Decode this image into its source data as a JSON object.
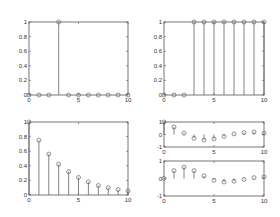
{
  "figure": {
    "background": "#ffffff",
    "axis_color": "#555555",
    "stem_color": "#666666"
  },
  "chart_data": [
    {
      "type": "stem",
      "title": "",
      "xlabel": "",
      "ylabel": "",
      "x": [
        0,
        1,
        2,
        3,
        4,
        5,
        6,
        7,
        8,
        9,
        10
      ],
      "values": [
        0,
        0,
        0,
        1,
        0,
        0,
        0,
        0,
        0,
        0,
        0
      ],
      "xlim": [
        0,
        10
      ],
      "ylim": [
        0,
        1
      ],
      "xticks": [
        0,
        5,
        10
      ],
      "yticks": [
        0,
        0.2,
        0.4,
        0.6,
        0.8,
        1
      ],
      "xtick_labels": [
        "0",
        "5",
        "10"
      ],
      "ytick_labels": [
        "0",
        "0.2",
        "0.4",
        "0.6",
        "0.8",
        "1"
      ],
      "frame": {
        "x": 29,
        "y": 22,
        "w": 99,
        "h": 73
      }
    },
    {
      "type": "stem",
      "title": "",
      "xlabel": "",
      "ylabel": "",
      "x": [
        0,
        1,
        2,
        3,
        4,
        5,
        6,
        7,
        8,
        9,
        10
      ],
      "values": [
        0,
        0,
        0,
        1,
        1,
        1,
        1,
        1,
        1,
        1,
        1
      ],
      "xlim": [
        0,
        10
      ],
      "ylim": [
        0,
        1
      ],
      "xticks": [
        0,
        5,
        10
      ],
      "yticks": [
        0,
        0.2,
        0.4,
        0.6,
        0.8,
        1
      ],
      "xtick_labels": [
        "0",
        "5",
        "10"
      ],
      "ytick_labels": [
        "0",
        "0.2",
        "0.4",
        "0.6",
        "0.8",
        "1"
      ],
      "frame": {
        "x": 164,
        "y": 22,
        "w": 100,
        "h": 73
      }
    },
    {
      "type": "stem",
      "title": "",
      "xlabel": "",
      "ylabel": "",
      "x": [
        0,
        1,
        2,
        3,
        4,
        5,
        6,
        7,
        8,
        9,
        10
      ],
      "values": [
        1,
        0.75,
        0.56,
        0.42,
        0.32,
        0.24,
        0.18,
        0.13,
        0.1,
        0.075,
        0.056
      ],
      "xlim": [
        0,
        10
      ],
      "ylim": [
        0,
        1
      ],
      "xticks": [
        0,
        5,
        10
      ],
      "yticks": [
        0,
        0.2,
        0.4,
        0.6,
        0.8,
        1
      ],
      "xtick_labels": [
        "0",
        "5",
        "10"
      ],
      "ytick_labels": [
        "0",
        "0.2",
        "0.4",
        "0.6",
        "0.8",
        "1"
      ],
      "frame": {
        "x": 29,
        "y": 122,
        "w": 99,
        "h": 73
      }
    },
    {
      "type": "stem",
      "title": "",
      "xlabel": "",
      "ylabel": "",
      "x": [
        0,
        1,
        2,
        3,
        4,
        5,
        6,
        7,
        8,
        9,
        10
      ],
      "values": [
        1,
        0.6,
        0.1,
        -0.3,
        -0.45,
        -0.35,
        -0.15,
        0.05,
        0.15,
        0.2,
        0.1
      ],
      "xlim": [
        0,
        10
      ],
      "ylim": [
        -1,
        1
      ],
      "xticks": [
        0,
        5,
        10
      ],
      "yticks": [
        -1,
        0,
        1
      ],
      "xtick_labels": [
        "0",
        "5",
        "10"
      ],
      "ytick_labels": [
        "-1",
        "0",
        "1"
      ],
      "frame": {
        "x": 164,
        "y": 122,
        "w": 100,
        "h": 25
      }
    },
    {
      "type": "stem",
      "title": "",
      "xlabel": "",
      "ylabel": "",
      "x": [
        0,
        1,
        2,
        3,
        4,
        5,
        6,
        7,
        8,
        9,
        10
      ],
      "values": [
        0,
        0.45,
        0.65,
        0.45,
        0.15,
        -0.1,
        -0.2,
        -0.15,
        -0.05,
        0.05,
        0.1
      ],
      "xlim": [
        0,
        10
      ],
      "ylim": [
        -1,
        1
      ],
      "xticks": [
        0,
        5,
        10
      ],
      "yticks": [
        -1,
        0,
        1
      ],
      "xtick_labels": [
        "0",
        "5",
        "10"
      ],
      "ytick_labels": [
        "-1",
        "0",
        "1"
      ],
      "frame": {
        "x": 164,
        "y": 161,
        "w": 100,
        "h": 35
      }
    }
  ]
}
